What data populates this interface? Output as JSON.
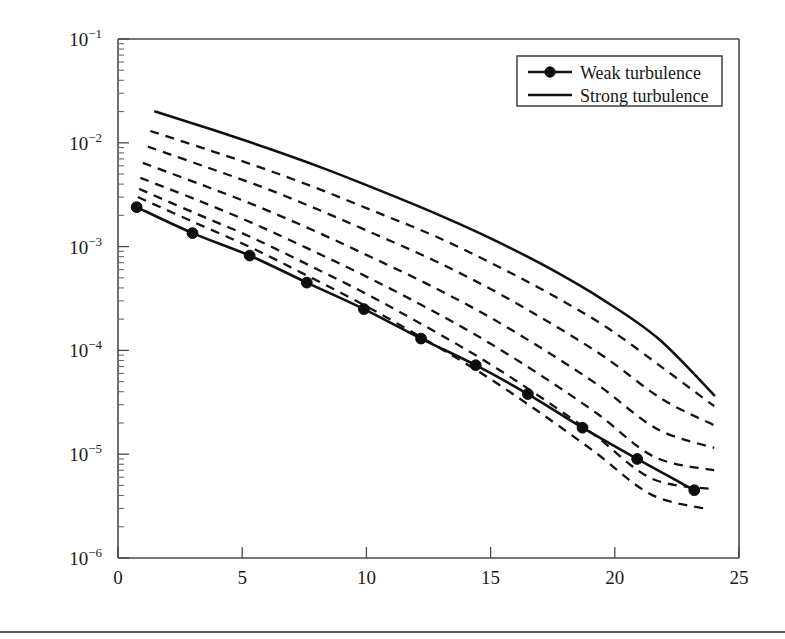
{
  "figure": {
    "background_color": "#ffffff",
    "line_color": "#111111",
    "frame_color": "#4a4a4a",
    "page_rule_present": true
  },
  "axes": {
    "x_title": "SNR, dB",
    "y_title": "<BER>",
    "x_tick_labels": [
      "0",
      "5",
      "10",
      "15",
      "20",
      "25"
    ],
    "y_tick_labels": [
      "10-1",
      "10-2",
      "10-3",
      "10-4",
      "10-5",
      "10-6"
    ],
    "y_tick_mantissa": "10",
    "y_tick_exponents": [
      "-1",
      "-2",
      "-3",
      "-4",
      "-5",
      "-6"
    ]
  },
  "legend": {
    "position": "upper-right",
    "entries": [
      {
        "label": "Weak turbulence",
        "style": "solid-with-marker"
      },
      {
        "label": "Strong turbulence",
        "style": "solid"
      }
    ]
  },
  "chart_data": {
    "type": "line",
    "title": "",
    "xlabel": "SNR, dB",
    "ylabel": "<BER>",
    "xlim": [
      0,
      25
    ],
    "ylim": [
      1e-06,
      0.1
    ],
    "yscale": "log",
    "xscale": "linear",
    "grid": false,
    "legend_position": "upper right",
    "series": [
      {
        "name": "Strong turbulence",
        "style": "solid",
        "markers": false,
        "x": [
          1.5,
          3.75,
          6.0,
          8.25,
          10.5,
          12.75,
          15.0,
          17.25,
          19.5,
          21.75,
          24.0
        ],
        "y": [
          0.02,
          0.0135,
          0.0089,
          0.0057,
          0.0035,
          0.0021,
          0.0012,
          0.00064,
          0.00031,
          0.00013,
          3.7e-05
        ]
      },
      {
        "name": "intermediate-1",
        "style": "dashed",
        "markers": false,
        "x": [
          1.3,
          3.6,
          5.9,
          8.2,
          10.5,
          12.8,
          15.1,
          17.4,
          19.7,
          22.0,
          24.0
        ],
        "y": [
          0.013,
          0.0086,
          0.0056,
          0.0035,
          0.0021,
          0.00125,
          0.00068,
          0.00035,
          0.000165,
          6.6e-05,
          2.9e-05
        ]
      },
      {
        "name": "intermediate-2",
        "style": "dashed",
        "markers": false,
        "x": [
          1.2,
          3.5,
          5.8,
          8.1,
          10.4,
          12.7,
          15.0,
          17.3,
          19.6,
          21.9,
          24.0
        ],
        "y": [
          0.0092,
          0.0059,
          0.00375,
          0.00225,
          0.0013,
          0.00074,
          0.00039,
          0.00019,
          8.6e-05,
          3.4e-05,
          1.9e-05
        ]
      },
      {
        "name": "intermediate-3",
        "style": "dashed",
        "markers": false,
        "x": [
          1.0,
          3.3,
          5.6,
          7.9,
          10.2,
          12.5,
          14.8,
          17.1,
          19.4,
          21.7,
          24.0
        ],
        "y": [
          0.0064,
          0.004,
          0.00245,
          0.00142,
          0.00079,
          0.00043,
          0.00022,
          0.000103,
          4.5e-05,
          1.75e-05,
          1.15e-05
        ]
      },
      {
        "name": "intermediate-4",
        "style": "dashed",
        "markers": false,
        "x": [
          0.9,
          3.2,
          5.5,
          7.8,
          10.1,
          12.4,
          14.7,
          17.0,
          19.3,
          21.6,
          24.0
        ],
        "y": [
          0.0046,
          0.0028,
          0.00165,
          0.00092,
          0.0005,
          0.00026,
          0.000128,
          5.8e-05,
          2.45e-05,
          9.4e-06,
          7e-06
        ]
      },
      {
        "name": "intermediate-5",
        "style": "dashed",
        "markers": false,
        "x": [
          0.85,
          3.1,
          5.4,
          7.7,
          10.0,
          12.3,
          14.6,
          16.9,
          19.2,
          21.5,
          24.0
        ],
        "y": [
          0.0036,
          0.0021,
          0.00122,
          0.00066,
          0.00035,
          0.000175,
          8.4e-05,
          3.7e-05,
          1.52e-05,
          5.8e-06,
          4.6e-06
        ]
      },
      {
        "name": "intermediate-6",
        "style": "dashed",
        "markers": false,
        "x": [
          0.8,
          3.05,
          5.35,
          7.65,
          9.95,
          12.25,
          14.55,
          16.85,
          19.15,
          21.45,
          23.6
        ],
        "y": [
          0.003,
          0.00172,
          0.00098,
          0.00052,
          0.00027,
          0.000132,
          6.2e-05,
          2.65e-05,
          1.07e-05,
          4.1e-06,
          3e-06
        ]
      },
      {
        "name": "Weak turbulence",
        "style": "solid",
        "markers": true,
        "x": [
          0.75,
          3.0,
          5.3,
          7.6,
          9.9,
          12.2,
          14.4,
          16.5,
          18.7,
          20.9,
          23.2
        ],
        "y": [
          0.0024,
          0.00135,
          0.00082,
          0.00045,
          0.00025,
          0.00013,
          7.2e-05,
          3.8e-05,
          1.8e-05,
          9e-06,
          4.5e-06
        ]
      }
    ]
  }
}
